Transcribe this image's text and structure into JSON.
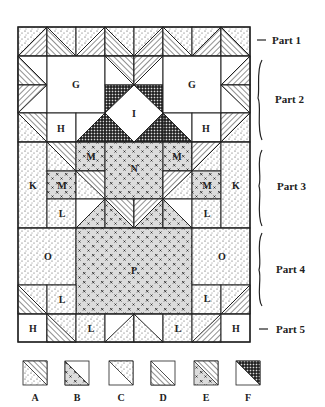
{
  "figure": {
    "type": "quilt-block-assembly-diagram",
    "piece_labels": {
      "G": "G",
      "H": "H",
      "I": "I",
      "K": "K",
      "L": "L",
      "M": "M",
      "N": "N",
      "O": "O",
      "P": "P"
    },
    "parts": [
      {
        "id": "part1",
        "label": "Part 1",
        "marker": "dash"
      },
      {
        "id": "part2",
        "label": "Part 2",
        "marker": "brace"
      },
      {
        "id": "part3",
        "label": "Part 3",
        "marker": "brace"
      },
      {
        "id": "part4",
        "label": "Part 4",
        "marker": "brace"
      },
      {
        "id": "part5",
        "label": "Part 5",
        "marker": "dash"
      }
    ],
    "legend": [
      {
        "key": "A",
        "description": "stipple / diagonal-stripe half-square triangle"
      },
      {
        "key": "B",
        "description": "x-print / white half-square triangle"
      },
      {
        "key": "C",
        "description": "stipple / white half-square triangle"
      },
      {
        "key": "D",
        "description": "diagonal-stripe / white half-square triangle"
      },
      {
        "key": "E",
        "description": "x-print / diagonal-stripe half-square triangle"
      },
      {
        "key": "F",
        "description": "cross-hatch / white half-square triangle"
      }
    ],
    "colors": {
      "ink": "#222222",
      "background": "#ffffff",
      "xprint_fill": "#dcdcdc"
    }
  }
}
